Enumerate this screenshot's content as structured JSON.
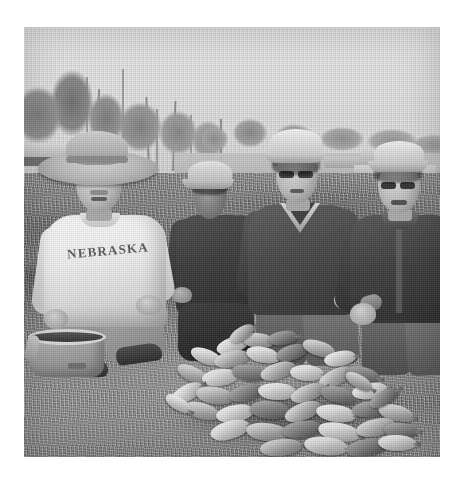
{
  "image": {
    "type": "photograph",
    "color_mode": "black-and-white",
    "caption": "Four men kneeling on grass behind a large pile of caught panfish at a lake boat ramp",
    "frame": {
      "background_color": "#ffffff",
      "photo_left": 24,
      "photo_top": 27,
      "photo_width": 416,
      "photo_height": 430
    },
    "scene": {
      "setting": "lakeside boat ramp / grassy bank",
      "time_of_day": "sunny daytime",
      "sky_color": "#d9d9d9",
      "grass_color": "#858585"
    },
    "background_elements": [
      {
        "name": "treeline",
        "position": "upper-left to upper-right"
      },
      {
        "name": "bare-snags",
        "position": "upper-center"
      },
      {
        "name": "distant-water",
        "position": "middle-right"
      },
      {
        "name": "parked-vehicles",
        "position": "middle-left and middle-right"
      },
      {
        "name": "boat",
        "position": "middle-right"
      }
    ],
    "people": [
      {
        "id": "man-1",
        "position": "far left, kneeling",
        "headwear": "wide-brim bucket hat",
        "eyewear": "eyeglasses",
        "facial_hair": "moustache",
        "top": "white crewneck sweatshirt",
        "shirt_text": "NEBRASKA",
        "bottom": "light jeans",
        "footwear": "dark boots"
      },
      {
        "id": "man-2",
        "position": "center left, kneeling behind",
        "headwear": "light baseball cap",
        "eyewear": "none visible",
        "facial_hair": "none visible",
        "top": "dark jacket",
        "shirt_text": "",
        "bottom": "dark pants",
        "footwear": "not visible"
      },
      {
        "id": "man-3",
        "position": "center right, kneeling",
        "headwear": "light baseball cap",
        "eyewear": "eyeglasses",
        "facial_hair": "none visible",
        "top": "dark pullover jacket with V-neck collar",
        "shirt_text": "",
        "bottom": "dark trousers",
        "footwear": "not visible"
      },
      {
        "id": "man-4",
        "position": "far right, kneeling",
        "headwear": "light baseball cap",
        "eyewear": "eyeglasses",
        "facial_hair": "none visible",
        "top": "dark button shirt",
        "shirt_text": "",
        "bottom": "dark trousers",
        "footwear": "not visible"
      }
    ],
    "foreground_objects": [
      {
        "name": "fish-pile",
        "description": "large pile of panfish (crappie / bluegill) laid out on the grass",
        "approximate_count": 44,
        "position": "center foreground"
      },
      {
        "name": "soft-cooler-bag",
        "description": "open soft-sided canvas bag / cooler",
        "position": "lower left, beside man 1"
      }
    ]
  }
}
